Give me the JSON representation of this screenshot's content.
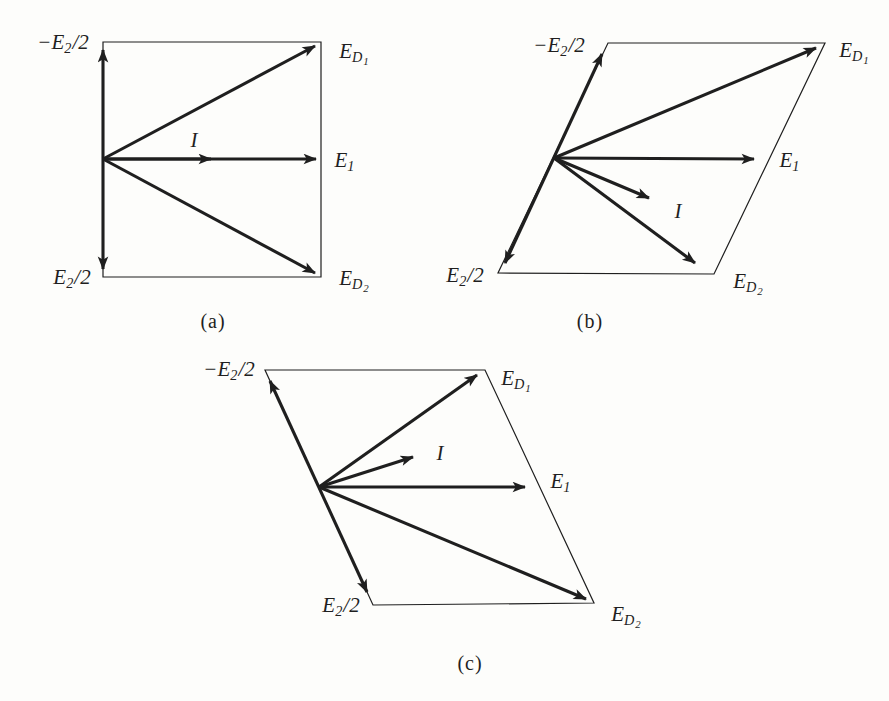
{
  "colors": {
    "ink": "#1f1f1f",
    "background": "#fdfdfb"
  },
  "diagrams": [
    {
      "id": "a",
      "caption": "(a)",
      "labels": {
        "neg_e2_half": {
          "pre": "−",
          "base": "E",
          "sub": "2",
          "post": "/2"
        },
        "e2_half": {
          "base": "E",
          "sub": "2",
          "post": "/2"
        },
        "ed1": {
          "base": "E",
          "sub": "D",
          "subsub": "1"
        },
        "ed2": {
          "base": "E",
          "sub": "D",
          "subsub": "2"
        },
        "e1": {
          "base": "E",
          "sub": "1"
        },
        "i": {
          "base": "I"
        }
      }
    },
    {
      "id": "b",
      "caption": "(b)",
      "labels": {
        "neg_e2_half": {
          "pre": "−",
          "base": "E",
          "sub": "2",
          "post": "/2"
        },
        "e2_half": {
          "base": "E",
          "sub": "2",
          "post": "/2"
        },
        "ed1": {
          "base": "E",
          "sub": "D",
          "subsub": "1"
        },
        "ed2": {
          "base": "E",
          "sub": "D",
          "subsub": "2"
        },
        "e1": {
          "base": "E",
          "sub": "1"
        },
        "i": {
          "base": "I"
        }
      }
    },
    {
      "id": "c",
      "caption": "(c)",
      "labels": {
        "neg_e2_half": {
          "pre": "−",
          "base": "E",
          "sub": "2",
          "post": "/2"
        },
        "e2_half": {
          "base": "E",
          "sub": "2",
          "post": "/2"
        },
        "ed1": {
          "base": "E",
          "sub": "D",
          "subsub": "1"
        },
        "ed2": {
          "base": "E",
          "sub": "D",
          "subsub": "2"
        },
        "e1": {
          "base": "E",
          "sub": "1"
        },
        "i": {
          "base": "I"
        }
      }
    }
  ]
}
